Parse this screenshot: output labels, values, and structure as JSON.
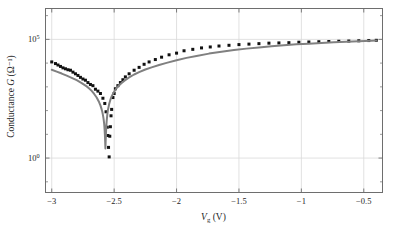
{
  "chart_data": {
    "type": "scatter",
    "title": "",
    "xlabel": "V_g (V)",
    "xlabel_parts": {
      "symbol": "V",
      "subscript": "g",
      "unit": "(V)"
    },
    "ylabel": "Conductance G (Ω⁻¹)",
    "ylabel_parts": {
      "text": "Conductance",
      "symbol": "G",
      "unit": "(Ω⁻¹)"
    },
    "xlim": [
      -3.05,
      -0.35
    ],
    "ylim_log_decades": [
      -1.45,
      6.3
    ],
    "yscale": "log",
    "grid": true,
    "legend": null,
    "xticks": [
      -3,
      -2.5,
      -2,
      -1.5,
      -1,
      -0.5
    ],
    "xticklabels": [
      "−3",
      "−2.5",
      "−2",
      "−1.5",
      "−1",
      "−0.5"
    ],
    "yticks_exponents": [
      5,
      0
    ],
    "yticklabels": [
      "10⁵",
      "10⁰"
    ],
    "ytick_mantissa": "10",
    "ytick_exponent_hi": "5",
    "ytick_exponent_lo": "0",
    "colors": {
      "measured_points": "#111111",
      "model_line": "#808080",
      "frame": "#6e6e6e",
      "grid": "#d9d9d9",
      "background": "#ffffff",
      "text": "#1f1f1f"
    },
    "series": [
      {
        "name": "measured",
        "style": "points",
        "marker": "square",
        "color": "#111111",
        "x": [
          -3.0,
          -2.97,
          -2.95,
          -2.93,
          -2.91,
          -2.89,
          -2.87,
          -2.85,
          -2.83,
          -2.81,
          -2.79,
          -2.77,
          -2.75,
          -2.73,
          -2.71,
          -2.69,
          -2.67,
          -2.65,
          -2.63,
          -2.61,
          -2.59,
          -2.575,
          -2.565,
          -2.555,
          -2.55,
          -2.545,
          -2.54,
          -2.535,
          -2.53,
          -2.525,
          -2.52,
          -2.51,
          -2.5,
          -2.49,
          -2.47,
          -2.45,
          -2.43,
          -2.41,
          -2.38,
          -2.34,
          -2.3,
          -2.26,
          -2.22,
          -2.17,
          -2.12,
          -2.06,
          -2.0,
          -1.94,
          -1.87,
          -1.8,
          -1.73,
          -1.66,
          -1.58,
          -1.5,
          -1.42,
          -1.34,
          -1.26,
          -1.18,
          -1.1,
          -1.02,
          -0.94,
          -0.86,
          -0.78,
          -0.7,
          -0.62,
          -0.54,
          -0.46,
          -0.4
        ],
        "y_log10": [
          4.05,
          3.98,
          3.92,
          3.86,
          3.8,
          3.76,
          3.72,
          3.7,
          3.62,
          3.55,
          3.48,
          3.4,
          3.33,
          3.28,
          3.18,
          3.1,
          3.05,
          2.9,
          2.82,
          2.72,
          2.52,
          2.3,
          1.95,
          1.3,
          0.95,
          0.45,
          0.05,
          0.92,
          1.32,
          1.78,
          2.05,
          2.55,
          2.72,
          2.92,
          3.05,
          3.18,
          3.3,
          3.42,
          3.55,
          3.7,
          3.82,
          3.95,
          4.05,
          4.15,
          4.25,
          4.35,
          4.42,
          4.52,
          4.58,
          4.64,
          4.68,
          4.72,
          4.75,
          4.78,
          4.8,
          4.82,
          4.84,
          4.85,
          4.86,
          4.88,
          4.89,
          4.9,
          4.91,
          4.92,
          4.93,
          4.94,
          4.95,
          4.96
        ]
      },
      {
        "name": "model",
        "style": "line",
        "color": "#808080",
        "x": [
          -3.0,
          -2.96,
          -2.92,
          -2.88,
          -2.84,
          -2.8,
          -2.76,
          -2.72,
          -2.7,
          -2.68,
          -2.66,
          -2.64,
          -2.62,
          -2.61,
          -2.6,
          -2.595,
          -2.59,
          -2.585,
          -2.58,
          -2.578,
          -2.576,
          -2.574,
          -2.572,
          -2.57,
          -2.568,
          -2.566,
          -2.564,
          -2.562,
          -2.56,
          -2.555,
          -2.55,
          -2.54,
          -2.53,
          -2.52,
          -2.5,
          -2.48,
          -2.45,
          -2.42,
          -2.38,
          -2.34,
          -2.3,
          -2.25,
          -2.2,
          -2.14,
          -2.08,
          -2.0,
          -1.92,
          -1.84,
          -1.74,
          -1.64,
          -1.54,
          -1.44,
          -1.34,
          -1.24,
          -1.14,
          -1.04,
          -0.94,
          -0.84,
          -0.74,
          -0.64,
          -0.54,
          -0.44,
          -0.4
        ],
        "y_log10": [
          3.72,
          3.64,
          3.56,
          3.47,
          3.38,
          3.28,
          3.16,
          3.02,
          2.93,
          2.83,
          2.7,
          2.55,
          2.35,
          2.22,
          2.05,
          1.95,
          1.82,
          1.66,
          1.45,
          1.32,
          1.16,
          0.96,
          0.7,
          0.4,
          0.72,
          1.0,
          1.22,
          1.4,
          1.55,
          1.82,
          2.02,
          2.28,
          2.46,
          2.6,
          2.8,
          2.95,
          3.12,
          3.25,
          3.4,
          3.52,
          3.62,
          3.73,
          3.82,
          3.92,
          4.01,
          4.12,
          4.22,
          4.3,
          4.4,
          4.48,
          4.55,
          4.61,
          4.66,
          4.71,
          4.75,
          4.79,
          4.82,
          4.85,
          4.88,
          4.9,
          4.92,
          4.94,
          4.95
        ]
      }
    ]
  }
}
